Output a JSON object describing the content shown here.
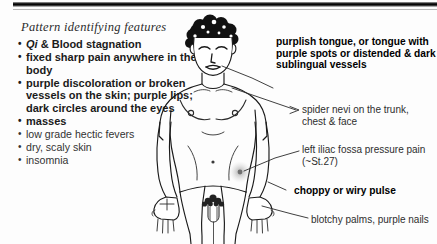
{
  "slide": {
    "title": "Pattern identifying features",
    "background_color": "#fdfdfd",
    "rule_color": "#000000"
  },
  "features": {
    "items": [
      {
        "text": "Qi & Blood stagnation",
        "emphasis": "strong",
        "italic_lead": "Qi",
        "rest": " & Blood stagnation"
      },
      {
        "text": "fixed sharp pain anywhere in the body",
        "emphasis": "strong"
      },
      {
        "text": "purple discoloration or broken vessels on the skin; purple lips; dark circles around the eyes",
        "emphasis": "strong"
      },
      {
        "text": "masses",
        "emphasis": "strong"
      },
      {
        "text": "low grade hectic fevers",
        "emphasis": "light"
      },
      {
        "text": "dry, scaly skin",
        "emphasis": "light"
      },
      {
        "text": "insomnia",
        "emphasis": "light"
      }
    ],
    "bullet_glyph": "•"
  },
  "annotations": [
    {
      "id": "tongue",
      "text": "purplish tongue, or tongue with purple spots or distended & dark sublingual vessels",
      "emphasis": "bold"
    },
    {
      "id": "spider-nevi",
      "text": "spider nevi on the trunk, chest & face",
      "emphasis": "thin"
    },
    {
      "id": "iliac-fossa",
      "text": "left iliac fossa pressure pain (~St.27)",
      "emphasis": "thin"
    },
    {
      "id": "pulse",
      "text": "choppy or wiry pulse",
      "emphasis": "bold"
    },
    {
      "id": "palms",
      "text": "blotchy palms, purple nails",
      "emphasis": "thin"
    }
  ],
  "figure": {
    "name": "male anatomical line drawing",
    "marker_label": "St.27 pressure point highlight",
    "marker_color": "#9a9a9a",
    "line_color": "#1a1a1a",
    "hair_color": "#111111"
  }
}
